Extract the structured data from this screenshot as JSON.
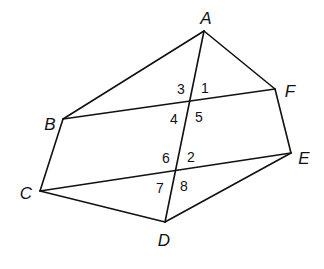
{
  "diagram": {
    "type": "geometry-figure",
    "stroke_color": "#111111",
    "background": "#ffffff",
    "points": [
      {
        "id": "A",
        "label": "A",
        "x": 204,
        "y": 31,
        "lx": 206,
        "ly": 18
      },
      {
        "id": "F",
        "label": "F",
        "x": 275,
        "y": 89,
        "lx": 290,
        "ly": 91
      },
      {
        "id": "E",
        "label": "E",
        "x": 291,
        "y": 153,
        "lx": 304,
        "ly": 158
      },
      {
        "id": "D",
        "label": "D",
        "x": 165,
        "y": 222,
        "lx": 164,
        "ly": 240
      },
      {
        "id": "C",
        "label": "C",
        "x": 40,
        "y": 191,
        "lx": 26,
        "ly": 193
      },
      {
        "id": "B",
        "label": "B",
        "x": 63,
        "y": 119,
        "lx": 50,
        "ly": 124
      }
    ],
    "segments": [
      [
        "A",
        "F"
      ],
      [
        "F",
        "E"
      ],
      [
        "E",
        "D"
      ],
      [
        "D",
        "C"
      ],
      [
        "C",
        "B"
      ],
      [
        "B",
        "A"
      ],
      [
        "A",
        "D"
      ],
      [
        "B",
        "F"
      ],
      [
        "C",
        "E"
      ]
    ],
    "angle_labels": [
      {
        "label": "3",
        "x": 181,
        "y": 89
      },
      {
        "label": "1",
        "x": 205,
        "y": 88
      },
      {
        "label": "4",
        "x": 174,
        "y": 119
      },
      {
        "label": "5",
        "x": 199,
        "y": 117
      },
      {
        "label": "6",
        "x": 166,
        "y": 158
      },
      {
        "label": "2",
        "x": 191,
        "y": 157
      },
      {
        "label": "7",
        "x": 160,
        "y": 188
      },
      {
        "label": "8",
        "x": 184,
        "y": 186
      }
    ]
  }
}
